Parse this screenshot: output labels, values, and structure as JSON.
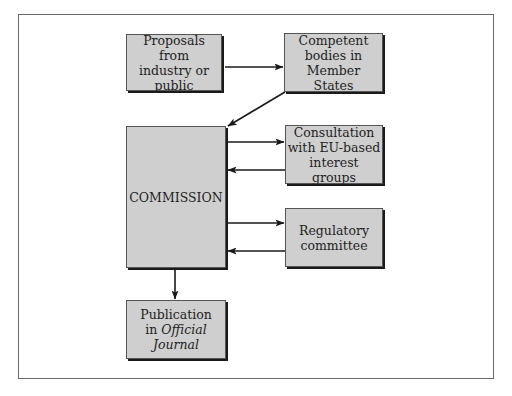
{
  "diagram": {
    "type": "flowchart",
    "nodes": [
      {
        "id": "proposals",
        "label": "Proposals from\nindustry or\npublic"
      },
      {
        "id": "competent",
        "label": "Competent\nbodies in\nMember States"
      },
      {
        "id": "commission",
        "label": "COMMISSION"
      },
      {
        "id": "consultation",
        "label": "Consultation\nwith EU-based\ninterest groups"
      },
      {
        "id": "regulatory",
        "label": "Regulatory\ncommittee"
      },
      {
        "id": "publication",
        "label_pre": "Publication\nin ",
        "label_italic": "Official\nJournal"
      }
    ],
    "edges": [
      {
        "from": "proposals",
        "to": "competent"
      },
      {
        "from": "competent",
        "to": "commission"
      },
      {
        "from": "commission",
        "to": "consultation"
      },
      {
        "from": "consultation",
        "to": "commission"
      },
      {
        "from": "commission",
        "to": "regulatory"
      },
      {
        "from": "regulatory",
        "to": "commission"
      },
      {
        "from": "commission",
        "to": "publication"
      }
    ],
    "colors": {
      "box_fill": "#cfcfcf",
      "box_shadow": "#1a1a1a",
      "line": "#1a1a1a",
      "frame": "#6a6a6a"
    }
  }
}
